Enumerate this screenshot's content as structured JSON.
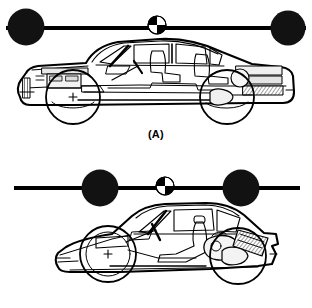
{
  "figure": {
    "type": "technical-line-diagram",
    "background_color": "#ffffff",
    "ink_color": "#000000"
  },
  "panels": [
    {
      "id": "A",
      "caption": "(A)",
      "vehicle": {
        "name": "sedan-cutaway",
        "description": "four-door sedan phantom-view side profile",
        "body_style": "sedan",
        "facing": "left",
        "highlighted_wheels": [
          "front",
          "rear"
        ],
        "wheel_marker": "crosshair"
      },
      "dumbbell": {
        "name": "dumbbell-far-masses",
        "bar": {
          "x1": 6,
          "x2": 306,
          "y": 28,
          "thickness": 4
        },
        "masses": [
          {
            "label": "front-mass",
            "cx": 26,
            "cy": 27,
            "r": 18,
            "fill": "#111111"
          },
          {
            "label": "rear-mass",
            "cx": 288,
            "cy": 28,
            "r": 17,
            "fill": "#111111"
          }
        ],
        "center_of_gravity": {
          "label": "cg-symbol",
          "cx": 157,
          "cy": 25,
          "r": 9
        }
      }
    },
    {
      "id": "B",
      "caption": "(B)",
      "vehicle": {
        "name": "sports-car-cutaway",
        "description": "two-door mid-engine sports car phantom-view side profile",
        "body_style": "sports-coupe",
        "facing": "left",
        "highlighted_wheels": [
          "front",
          "rear"
        ],
        "wheel_marker": "crosshair"
      },
      "dumbbell": {
        "name": "dumbbell-near-masses",
        "bar": {
          "x1": 14,
          "x2": 300,
          "y": 34,
          "thickness": 4
        },
        "masses": [
          {
            "label": "front-mass",
            "cx": 100,
            "cy": 34,
            "r": 18,
            "fill": "#111111"
          },
          {
            "label": "rear-mass",
            "cx": 241,
            "cy": 34,
            "r": 18,
            "fill": "#111111"
          }
        ],
        "center_of_gravity": {
          "label": "cg-symbol",
          "cx": 165,
          "cy": 32,
          "r": 9
        }
      }
    }
  ]
}
